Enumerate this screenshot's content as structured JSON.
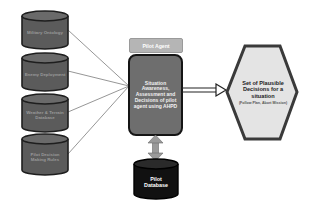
{
  "diagram": {
    "sources": [
      {
        "label": "Military Ontology"
      },
      {
        "label": "Enemy Deployment"
      },
      {
        "label": "Weather & Terrain Database"
      },
      {
        "label": "Pilot Decision Making Rules"
      }
    ],
    "agent": {
      "tag": "Pilot Agent",
      "process": "Situation Awareness, Assessment and Decisions of pilot agent using AHPD"
    },
    "output": {
      "title": "Set of Plausible Decisions for a situation",
      "subtitle": "(Follow Plan, Abort Mission)"
    },
    "database": {
      "label": "Pilot Database"
    },
    "colors": {
      "cylinder_fill": "#5b5b5b",
      "cylinder_stroke": "#1e1e1e",
      "center_fill": "#6e6e6e",
      "hex_fill": "#e4e4e4",
      "hex_stroke": "#3a3a3a",
      "db_fill": "#111111",
      "connector": "#8a8a8a"
    }
  }
}
